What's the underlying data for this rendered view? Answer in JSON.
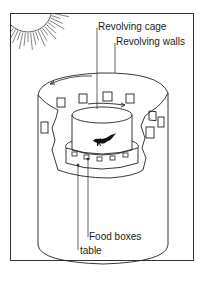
{
  "diagram": {
    "labels": {
      "revolving_cage": "Revolving cage",
      "revolving_walls": "Revolving walls",
      "food_boxes": "Food boxes",
      "table": "table"
    },
    "colors": {
      "ink": "#222222",
      "background": "#ffffff"
    }
  }
}
